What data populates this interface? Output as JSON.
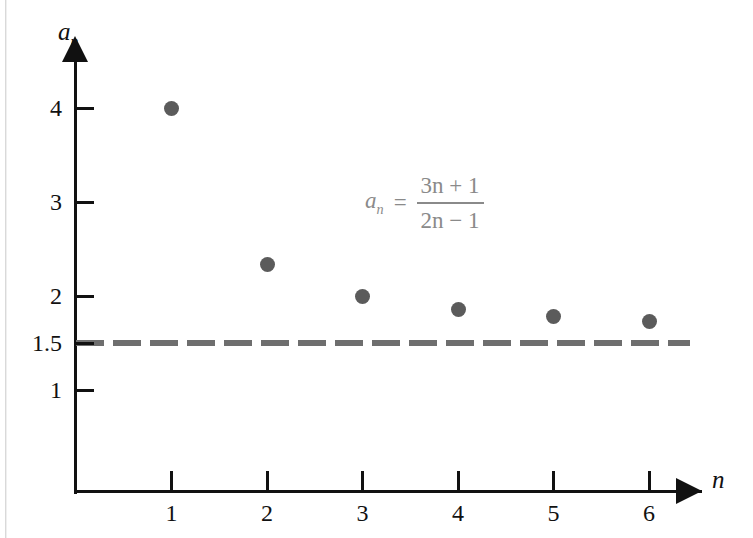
{
  "chart_data": {
    "type": "scatter",
    "title": "",
    "xlabel": "n",
    "ylabel": "a_n",
    "x": [
      1,
      2,
      3,
      4,
      5,
      6
    ],
    "values": [
      4.0,
      2.333,
      2.0,
      1.857,
      1.778,
      1.727
    ],
    "series": [
      {
        "name": "a_n = (3n + 1) / (2n - 1)",
        "x": [
          1,
          2,
          3,
          4,
          5,
          6
        ],
        "values": [
          4.0,
          2.333,
          2.0,
          1.857,
          1.778,
          1.727
        ]
      }
    ],
    "xlim": [
      0,
      6.7
    ],
    "ylim": [
      0,
      4.6
    ],
    "x_ticks": [
      "1",
      "2",
      "3",
      "4",
      "5",
      "6"
    ],
    "y_ticks": [
      "4",
      "3",
      "2",
      "1.5",
      "1"
    ],
    "grid": false,
    "legend": "none",
    "annotations": [
      {
        "name": "formula",
        "lhs": "a",
        "lhs_sub": "n",
        "equals": "=",
        "numerator": "3n + 1",
        "denominator": "2n − 1",
        "color": "#8a8a8a"
      }
    ],
    "reference_lines": [
      {
        "name": "limit",
        "orientation": "horizontal",
        "value": 1.5,
        "style": "dashed",
        "color": "#6e6e6e"
      }
    ],
    "colors": {
      "point": "#5b5b5b",
      "axis": "#111111",
      "limit_line": "#6e6e6e",
      "annotation": "#8a8a8a",
      "background": "#ffffff"
    }
  },
  "axes": {
    "y_title_main": "a",
    "y_title_sub": "n",
    "x_title": "n",
    "y_ticks": [
      {
        "label": "4",
        "value": 4
      },
      {
        "label": "3",
        "value": 3
      },
      {
        "label": "2",
        "value": 2
      },
      {
        "label": "1.5",
        "value": 1.5
      },
      {
        "label": "1",
        "value": 1
      }
    ],
    "x_ticks": [
      {
        "label": "1",
        "value": 1
      },
      {
        "label": "2",
        "value": 2
      },
      {
        "label": "3",
        "value": 3
      },
      {
        "label": "4",
        "value": 4
      },
      {
        "label": "5",
        "value": 5
      },
      {
        "label": "6",
        "value": 6
      }
    ]
  },
  "formula": {
    "lhs": "a",
    "lhs_sub": "n",
    "equals": "=",
    "numerator": "3n + 1",
    "denominator": "2n − 1"
  }
}
